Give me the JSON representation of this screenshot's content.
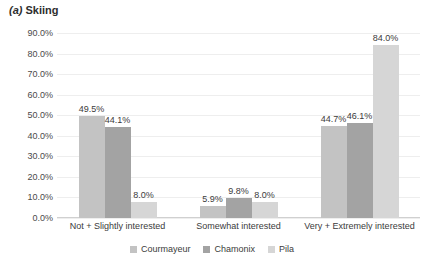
{
  "chart_data": {
    "type": "bar",
    "title": "(a) Skiing",
    "title_tag": "(a)",
    "title_text": "Skiing",
    "xlabel": "",
    "ylabel": "",
    "ylim": [
      0,
      90
    ],
    "grid": true,
    "legend_position": "bottom",
    "ytick_labels": [
      "90.0%",
      "80.0%",
      "70.0%",
      "60.0%",
      "50.0%",
      "40.0%",
      "30.0%",
      "20.0%",
      "10.0%",
      "0.0%"
    ],
    "ytick_values": [
      90,
      80,
      70,
      60,
      50,
      40,
      30,
      20,
      10,
      0
    ],
    "categories": [
      "Not + Slightly interested",
      "Somewhat interested",
      "Very + Extremely interested"
    ],
    "series": [
      {
        "name": "Courmayeur",
        "color": "#c3c3c3",
        "values": [
          49.5,
          5.9,
          44.7
        ],
        "labels": [
          "49.5%",
          "5.9%",
          "44.7%"
        ]
      },
      {
        "name": "Chamonix",
        "color": "#a3a3a3",
        "values": [
          44.1,
          9.8,
          46.1
        ],
        "labels": [
          "44.1%",
          "9.8%",
          "46.1%"
        ]
      },
      {
        "name": "Pila",
        "color": "#d6d6d6",
        "values": [
          8.0,
          8.0,
          84.0
        ],
        "labels": [
          "8.0%",
          "8.0%",
          "84.0%"
        ]
      }
    ]
  }
}
